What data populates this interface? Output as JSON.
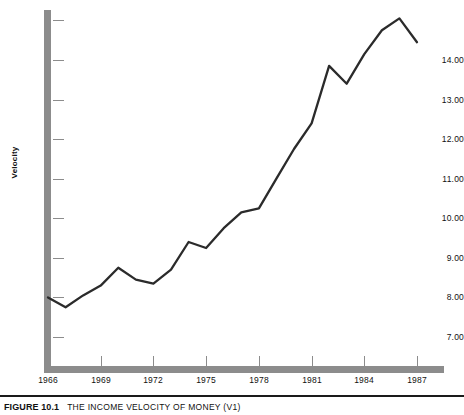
{
  "caption": {
    "number": "FIGURE 10.1",
    "title": "THE INCOME VELOCITY OF MONEY (V1)"
  },
  "colors": {
    "axis": "#8c8c8c",
    "line": "#2b2b2b",
    "text": "#111111",
    "background": "#ffffff"
  },
  "chart_data": {
    "type": "line",
    "title": "THE INCOME VELOCITY OF MONEY (V1)",
    "xlabel": "",
    "ylabel": "Velocity",
    "grid": false,
    "legend": null,
    "xlim": [
      1966,
      1988
    ],
    "ylim": [
      6.75,
      15.35
    ],
    "xticks": [
      1966,
      1969,
      1972,
      1975,
      1978,
      1981,
      1984,
      1987
    ],
    "xtick_labels": [
      "1966",
      "1969",
      "1972",
      "1975",
      "1978",
      "1981",
      "1984",
      "1987"
    ],
    "yticks": [
      7.0,
      8.0,
      9.0,
      10.0,
      11.0,
      12.0,
      13.0,
      14.0,
      15.0
    ],
    "ytick_labels": [
      "7.00",
      "8.00",
      "9.00",
      "10.00",
      "11.00",
      "12.00",
      "13.00",
      "14.00",
      ""
    ],
    "x": [
      1966,
      1967,
      1968,
      1969,
      1970,
      1971,
      1972,
      1973,
      1974,
      1975,
      1976,
      1977,
      1978,
      1979,
      1980,
      1981,
      1982,
      1983,
      1984,
      1985,
      1986,
      1987
    ],
    "values": [
      8.0,
      7.75,
      8.05,
      8.3,
      8.75,
      8.45,
      8.35,
      8.7,
      9.4,
      9.25,
      9.75,
      10.15,
      10.25,
      11.0,
      11.75,
      12.4,
      13.85,
      13.4,
      14.15,
      14.75,
      15.05,
      14.45
    ],
    "series": [
      {
        "name": "Velocity (V1)",
        "values": [
          8.0,
          7.75,
          8.05,
          8.3,
          8.75,
          8.45,
          8.35,
          8.7,
          9.4,
          9.25,
          9.75,
          10.15,
          10.25,
          11.0,
          11.75,
          12.4,
          13.85,
          13.4,
          14.15,
          14.75,
          15.05,
          14.45
        ]
      }
    ]
  }
}
